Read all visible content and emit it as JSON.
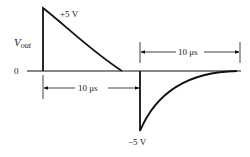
{
  "diagram": {
    "y_axis_label_main": "V",
    "y_axis_label_sub": "out",
    "zero_label": "0",
    "positive_peak_label": "+5 V",
    "negative_peak_label": "−5 V",
    "dimension_bottom_label": "10 μs",
    "dimension_top_label": "10 μs",
    "colors": {
      "stroke": "#111111",
      "background": "#ffffff"
    }
  }
}
